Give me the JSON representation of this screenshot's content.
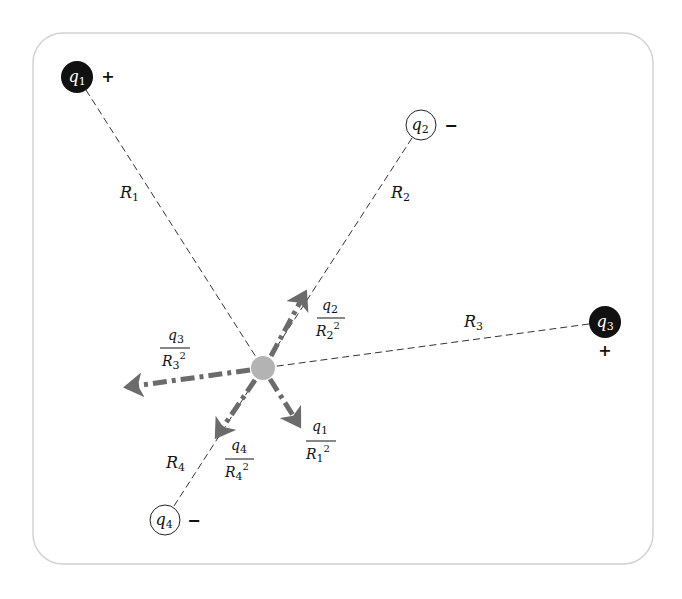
{
  "diagram": {
    "frame": {
      "stroke": "#d0d0d0"
    },
    "center_charge": {
      "color": "#b3b3b3"
    },
    "arrow_color": "#6b6b6b",
    "charges": [
      {
        "name": "q",
        "sub": "1",
        "sign": "+",
        "fill": "#111111",
        "text": "#ffffff"
      },
      {
        "name": "q",
        "sub": "2",
        "sign": "−",
        "fill": "#ffffff",
        "text": "#111111"
      },
      {
        "name": "q",
        "sub": "3",
        "sign": "+",
        "fill": "#111111",
        "text": "#ffffff"
      },
      {
        "name": "q",
        "sub": "4",
        "sign": "−",
        "fill": "#ffffff",
        "text": "#111111"
      }
    ],
    "distances": [
      {
        "name": "R",
        "sub": "1"
      },
      {
        "name": "R",
        "sub": "2"
      },
      {
        "name": "R",
        "sub": "3"
      },
      {
        "name": "R",
        "sub": "4"
      }
    ],
    "force_labels": [
      {
        "num": "q",
        "num_sub": "1",
        "den": "R",
        "den_sub": "1",
        "exp": "2"
      },
      {
        "num": "q",
        "num_sub": "2",
        "den": "R",
        "den_sub": "2",
        "exp": "2"
      },
      {
        "num": "q",
        "num_sub": "3",
        "den": "R",
        "den_sub": "3",
        "exp": "2"
      },
      {
        "num": "q",
        "num_sub": "4",
        "den": "R",
        "den_sub": "4",
        "exp": "2"
      }
    ]
  }
}
